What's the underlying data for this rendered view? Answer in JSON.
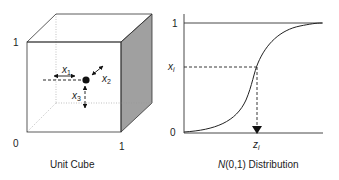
{
  "left_panel": {
    "caption": "Unit Cube",
    "axis_labels": {
      "origin": "0",
      "top": "1",
      "right": "1"
    },
    "vector_labels": {
      "x1": "x",
      "x1_sub": "1",
      "x2": "x",
      "x2_sub": "2",
      "x3": "x",
      "x3_sub": "3"
    },
    "colors": {
      "line": "#333333",
      "shade": "#9a9a9a",
      "point": "#111111"
    }
  },
  "right_panel": {
    "caption_italic": "N",
    "caption_rest": "(0,1) Distribution",
    "y_labels": {
      "one": "1",
      "xi": "x",
      "xi_sub": "i",
      "zero": "0"
    },
    "x_label": "z",
    "x_label_sub": "i",
    "colors": {
      "line": "#333333",
      "curve": "#222222"
    }
  }
}
